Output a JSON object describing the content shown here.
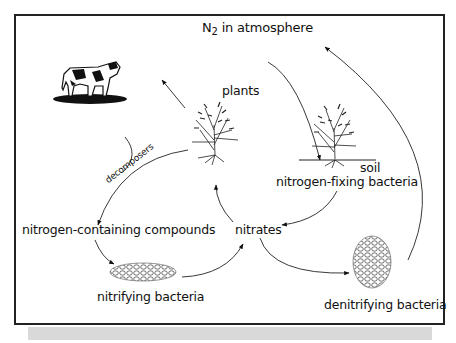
{
  "diagram": {
    "nodes": {
      "atmosphere": {
        "prefix": "N",
        "sub": "2",
        "suffix": " in atmosphere"
      },
      "plants": "plants",
      "soil": "soil",
      "nitrogen_fixing": "nitrogen-fixing bacteria",
      "compounds": "nitrogen-containing compounds",
      "nitrates": "nitrates",
      "nitrifying": "nitrifying bacteria",
      "denitrifying": "denitrifying bacteria",
      "decomposers": "decomposers"
    },
    "edges": [
      {
        "from": "atmosphere",
        "to": "nitrogen-fixing bacteria (plant roots in soil)"
      },
      {
        "from": "nitrogen-fixing bacteria",
        "to": "nitrates"
      },
      {
        "from": "nitrates",
        "to": "plants"
      },
      {
        "from": "plants",
        "to": "animals (cow)"
      },
      {
        "from": "plants / animals",
        "to": "nitrogen-containing compounds",
        "label": "decomposers"
      },
      {
        "from": "nitrogen-containing compounds",
        "to": "nitrifying bacteria"
      },
      {
        "from": "nitrifying bacteria",
        "to": "nitrates"
      },
      {
        "from": "nitrates",
        "to": "denitrifying bacteria"
      },
      {
        "from": "denitrifying bacteria",
        "to": "atmosphere"
      }
    ],
    "icons": [
      "cow-icon",
      "plant-icon",
      "plant-with-roots-icon",
      "nitrifying-bacteria-icon",
      "denitrifying-bacteria-icon"
    ]
  }
}
